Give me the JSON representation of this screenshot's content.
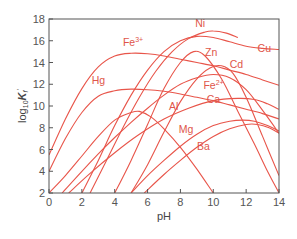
{
  "chart_data": {
    "type": "line",
    "title": "",
    "xlabel": "pH",
    "ylabel": "log10 Kf'",
    "xlim": [
      0,
      14
    ],
    "ylim": [
      2,
      18
    ],
    "x_ticks": [
      0,
      2,
      4,
      6,
      8,
      10,
      12,
      14
    ],
    "y_ticks": [
      2,
      4,
      6,
      8,
      10,
      12,
      14,
      16,
      18
    ],
    "grid": false,
    "legend": "none (curves labeled inline)",
    "color": "#e8554a",
    "series": [
      {
        "name": "Fe3+",
        "label": "Fe",
        "sup": "3+",
        "label_pos": [
          4.5,
          15.5
        ],
        "points": [
          [
            0.0,
            5.5
          ],
          [
            1.0,
            8.8
          ],
          [
            2.0,
            11.6
          ],
          [
            3.0,
            13.6
          ],
          [
            4.0,
            14.6
          ],
          [
            5.0,
            14.85
          ],
          [
            6.0,
            14.8
          ],
          [
            7.0,
            14.6
          ],
          [
            8.0,
            14.3
          ],
          [
            9.0,
            14.0
          ],
          [
            10.0,
            13.7
          ],
          [
            11.0,
            13.3
          ],
          [
            12.0,
            12.9
          ],
          [
            13.0,
            12.4
          ],
          [
            14.0,
            11.9
          ]
        ]
      },
      {
        "name": "Hg",
        "label": "Hg",
        "sup": "",
        "label_pos": [
          2.6,
          12.0
        ],
        "points": [
          [
            0.0,
            4.0
          ],
          [
            1.0,
            7.0
          ],
          [
            2.0,
            9.4
          ],
          [
            3.0,
            10.9
          ],
          [
            4.0,
            11.4
          ],
          [
            5.0,
            11.55
          ],
          [
            6.0,
            11.5
          ],
          [
            7.0,
            11.35
          ],
          [
            8.0,
            11.1
          ],
          [
            9.0,
            10.8
          ],
          [
            10.0,
            10.5
          ],
          [
            11.0,
            10.1
          ],
          [
            12.0,
            9.7
          ],
          [
            13.0,
            9.3
          ],
          [
            14.0,
            8.8
          ]
        ]
      },
      {
        "name": "Ni",
        "label": "Ni",
        "sup": "",
        "label_pos": [
          8.9,
          17.3
        ],
        "points": [
          [
            2.5,
            2.0
          ],
          [
            3.5,
            5.0
          ],
          [
            4.5,
            8.0
          ],
          [
            5.5,
            10.8
          ],
          [
            6.5,
            13.2
          ],
          [
            7.5,
            15.0
          ],
          [
            8.5,
            16.2
          ],
          [
            9.5,
            16.8
          ],
          [
            10.0,
            16.9
          ],
          [
            10.8,
            16.7
          ],
          [
            11.5,
            16.3
          ]
        ]
      },
      {
        "name": "Cu",
        "label": "Cu",
        "sup": "",
        "label_pos": [
          12.7,
          15.0
        ],
        "points": [
          [
            2.0,
            2.0
          ],
          [
            3.0,
            5.0
          ],
          [
            4.0,
            8.2
          ],
          [
            5.0,
            11.0
          ],
          [
            6.0,
            13.3
          ],
          [
            7.0,
            15.0
          ],
          [
            8.0,
            16.0
          ],
          [
            9.0,
            16.4
          ],
          [
            10.0,
            16.3
          ],
          [
            11.0,
            15.9
          ],
          [
            12.0,
            15.5
          ],
          [
            13.0,
            15.3
          ],
          [
            14.0,
            15.2
          ]
        ]
      },
      {
        "name": "Zn",
        "label": "Zn",
        "sup": "",
        "label_pos": [
          9.5,
          14.6
        ],
        "points": [
          [
            4.0,
            2.0
          ],
          [
            5.0,
            5.0
          ],
          [
            6.0,
            8.3
          ],
          [
            7.0,
            11.6
          ],
          [
            8.0,
            14.0
          ],
          [
            8.8,
            15.0
          ],
          [
            9.5,
            14.6
          ],
          [
            10.5,
            12.5
          ],
          [
            11.5,
            9.5
          ],
          [
            12.5,
            6.5
          ],
          [
            13.3,
            4.0
          ],
          [
            14.0,
            2.0
          ]
        ]
      },
      {
        "name": "Cd",
        "label": "Cd",
        "sup": "",
        "label_pos": [
          11.0,
          13.5
        ],
        "points": [
          [
            5.0,
            2.0
          ],
          [
            6.0,
            4.6
          ],
          [
            7.0,
            7.6
          ],
          [
            8.0,
            10.4
          ],
          [
            9.0,
            12.5
          ],
          [
            9.8,
            13.5
          ],
          [
            10.5,
            13.7
          ],
          [
            11.2,
            13.0
          ],
          [
            12.0,
            10.8
          ],
          [
            13.0,
            7.2
          ],
          [
            14.0,
            3.6
          ]
        ]
      },
      {
        "name": "Fe2+",
        "label": "Fe",
        "sup": "2+",
        "label_pos": [
          9.4,
          11.6
        ],
        "points": [
          [
            0.8,
            2.0
          ],
          [
            2.0,
            4.0
          ],
          [
            3.0,
            5.6
          ],
          [
            4.0,
            7.1
          ],
          [
            5.0,
            8.5
          ],
          [
            6.0,
            9.8
          ],
          [
            7.0,
            11.0
          ],
          [
            8.0,
            12.0
          ],
          [
            9.0,
            12.6
          ],
          [
            10.0,
            12.9
          ],
          [
            11.0,
            12.6
          ],
          [
            12.0,
            11.5
          ],
          [
            13.0,
            9.6
          ],
          [
            14.0,
            7.5
          ]
        ]
      },
      {
        "name": "Ca",
        "label": "Ca",
        "sup": "",
        "label_pos": [
          9.6,
          10.3
        ],
        "points": [
          [
            1.2,
            2.0
          ],
          [
            2.5,
            3.8
          ],
          [
            4.0,
            5.7
          ],
          [
            5.5,
            7.4
          ],
          [
            7.0,
            8.8
          ],
          [
            8.5,
            9.8
          ],
          [
            10.0,
            10.5
          ],
          [
            11.5,
            10.7
          ],
          [
            12.5,
            10.6
          ],
          [
            13.3,
            10.2
          ],
          [
            14.0,
            9.7
          ]
        ]
      },
      {
        "name": "Al",
        "label": "Al",
        "sup": "",
        "label_pos": [
          7.3,
          9.6
        ],
        "points": [
          [
            0.0,
            2.0
          ],
          [
            1.0,
            3.6
          ],
          [
            2.0,
            5.4
          ],
          [
            3.0,
            7.2
          ],
          [
            4.0,
            8.7
          ],
          [
            5.0,
            9.4
          ],
          [
            5.5,
            9.5
          ],
          [
            6.2,
            9.0
          ],
          [
            7.0,
            7.9
          ],
          [
            8.0,
            6.2
          ],
          [
            9.0,
            4.2
          ],
          [
            10.0,
            2.0
          ]
        ]
      },
      {
        "name": "Mg",
        "label": "Mg",
        "sup": "",
        "label_pos": [
          7.9,
          7.5
        ],
        "points": [
          [
            5.0,
            2.0
          ],
          [
            6.0,
            3.6
          ],
          [
            7.0,
            5.0
          ],
          [
            8.0,
            6.3
          ],
          [
            9.0,
            7.4
          ],
          [
            10.0,
            8.2
          ],
          [
            11.0,
            8.6
          ],
          [
            11.8,
            8.7
          ],
          [
            12.5,
            8.6
          ],
          [
            13.3,
            8.2
          ],
          [
            14.0,
            7.7
          ]
        ]
      },
      {
        "name": "Ba",
        "label": "Ba",
        "sup": "",
        "label_pos": [
          9.0,
          6.0
        ],
        "points": [
          [
            5.8,
            2.0
          ],
          [
            7.0,
            3.7
          ],
          [
            8.0,
            5.0
          ],
          [
            9.0,
            6.2
          ],
          [
            10.0,
            7.2
          ],
          [
            11.0,
            7.9
          ],
          [
            12.0,
            8.3
          ],
          [
            12.7,
            8.3
          ],
          [
            13.4,
            8.0
          ],
          [
            14.0,
            7.5
          ]
        ]
      }
    ]
  },
  "axes": {
    "x_title": "pH",
    "y_title_main": "log",
    "y_title_sub": "10",
    "y_title_k": "K",
    "y_title_k_sub": "f",
    "y_title_prime": "'"
  }
}
